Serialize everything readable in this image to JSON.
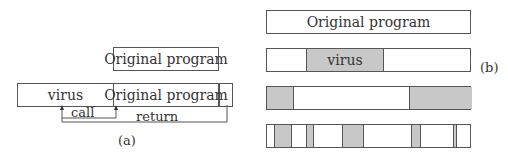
{
  "panel_a": {
    "top_box_label": "Original program",
    "bottom_virus_label": "virus",
    "bottom_original_label": "Original program",
    "call_label": "call",
    "return_label": "return",
    "caption": "(a)"
  },
  "panel_b": {
    "caption": "(b)",
    "row1_label": "Original program",
    "row2_virus_label": "virus"
  },
  "colors": {
    "shade": "#c8c8c8",
    "stroke": "#555555"
  }
}
